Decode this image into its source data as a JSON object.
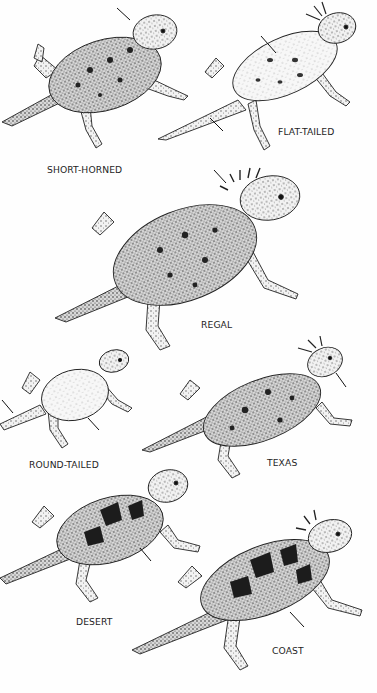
{
  "plate": {
    "background": "#fefefe",
    "ink": "#1e1e1e",
    "species": [
      {
        "id": "short-horned",
        "label": "SHORT-HORNED",
        "label_pos": [
          47,
          164
        ]
      },
      {
        "id": "flat-tailed",
        "label": "FLAT-TAILED",
        "label_pos": [
          278,
          126
        ]
      },
      {
        "id": "regal",
        "label": "REGAL",
        "label_pos": [
          201,
          319
        ]
      },
      {
        "id": "round-tailed",
        "label": "ROUND-TAILED",
        "label_pos": [
          29,
          459
        ]
      },
      {
        "id": "texas",
        "label": "TEXAS",
        "label_pos": [
          267,
          457
        ]
      },
      {
        "id": "desert",
        "label": "DESERT",
        "label_pos": [
          76,
          616
        ]
      },
      {
        "id": "coast",
        "label": "COAST",
        "label_pos": [
          272,
          645
        ]
      }
    ]
  }
}
